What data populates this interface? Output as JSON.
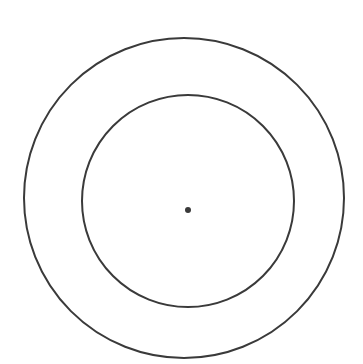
{
  "diagram": {
    "background": "#ffffff",
    "stroke_color": "#3a3a3a",
    "shapes": [
      {
        "name": "outer-circle",
        "type": "circle",
        "cx": 184,
        "cy": 198,
        "r": 160,
        "stroke_width": 2
      },
      {
        "name": "inner-circle",
        "type": "circle",
        "cx": 188,
        "cy": 201,
        "r": 106,
        "stroke_width": 2
      },
      {
        "name": "center-dot",
        "type": "dot",
        "cx": 188,
        "cy": 210,
        "r": 3
      }
    ]
  }
}
